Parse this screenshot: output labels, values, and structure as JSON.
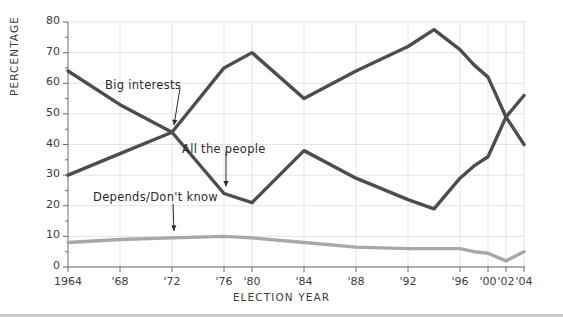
{
  "chart_data": {
    "type": "line",
    "title": "",
    "xlabel": "ELECTION YEAR",
    "ylabel": "PERCENTAGE",
    "ylim": [
      0,
      80
    ],
    "ytick_values": [
      0,
      10,
      20,
      30,
      40,
      50,
      60,
      70,
      80
    ],
    "ytick_labels": [
      "0",
      "10",
      "20",
      "30",
      "40",
      "50",
      "60",
      "70",
      "80"
    ],
    "yminor_step": 5,
    "grid": "horizontal-and-vertical-major",
    "legend_position": "inline-annotations",
    "x": [
      1964,
      1968,
      1972,
      1976,
      1980,
      1984,
      1988,
      1992,
      1994,
      1996,
      1998,
      2000,
      2002,
      2004
    ],
    "xtick_values": [
      1964,
      1968,
      1972,
      1976,
      1980,
      1984,
      1988,
      1992,
      1996,
      2000,
      2002,
      2004
    ],
    "xtick_labels": [
      "1964",
      "'68",
      "'72",
      "'76",
      "'80",
      "'84",
      "'88",
      "'92",
      "'96",
      "'00",
      "'02",
      "'04"
    ],
    "series": [
      {
        "name": "All the people",
        "color": "#4d4d4d",
        "values": [
          64,
          53,
          44,
          24,
          21,
          38,
          29,
          22,
          19,
          29,
          33,
          36,
          49,
          56
        ]
      },
      {
        "name": "Big interests",
        "color": "#4d4d4d",
        "values": [
          30,
          37,
          44,
          65,
          70,
          55,
          64,
          72,
          77.5,
          71,
          66,
          62,
          49,
          40
        ]
      },
      {
        "name": "Depends/Don't know",
        "color": "#a8a8a8",
        "values": [
          8,
          9,
          9.5,
          10,
          9.5,
          8,
          6.5,
          6,
          6,
          6,
          5,
          4.5,
          2,
          5
        ]
      }
    ],
    "annotations": [
      {
        "text": "Big interests",
        "points_to_series": "Big interests",
        "points_to_x": 1972
      },
      {
        "text": "All the people",
        "points_to_series": "All the people",
        "points_to_x": 1976
      },
      {
        "text": "Depends/Don't know",
        "points_to_series": "Depends/Don't know",
        "points_to_x": 1972
      }
    ]
  },
  "colors": {
    "dark_line": "#4d4d4d",
    "light_line": "#a8a8a8",
    "grid": "#e3e3e3",
    "axis": "#6b6b6b",
    "text": "#3b3b3b"
  }
}
